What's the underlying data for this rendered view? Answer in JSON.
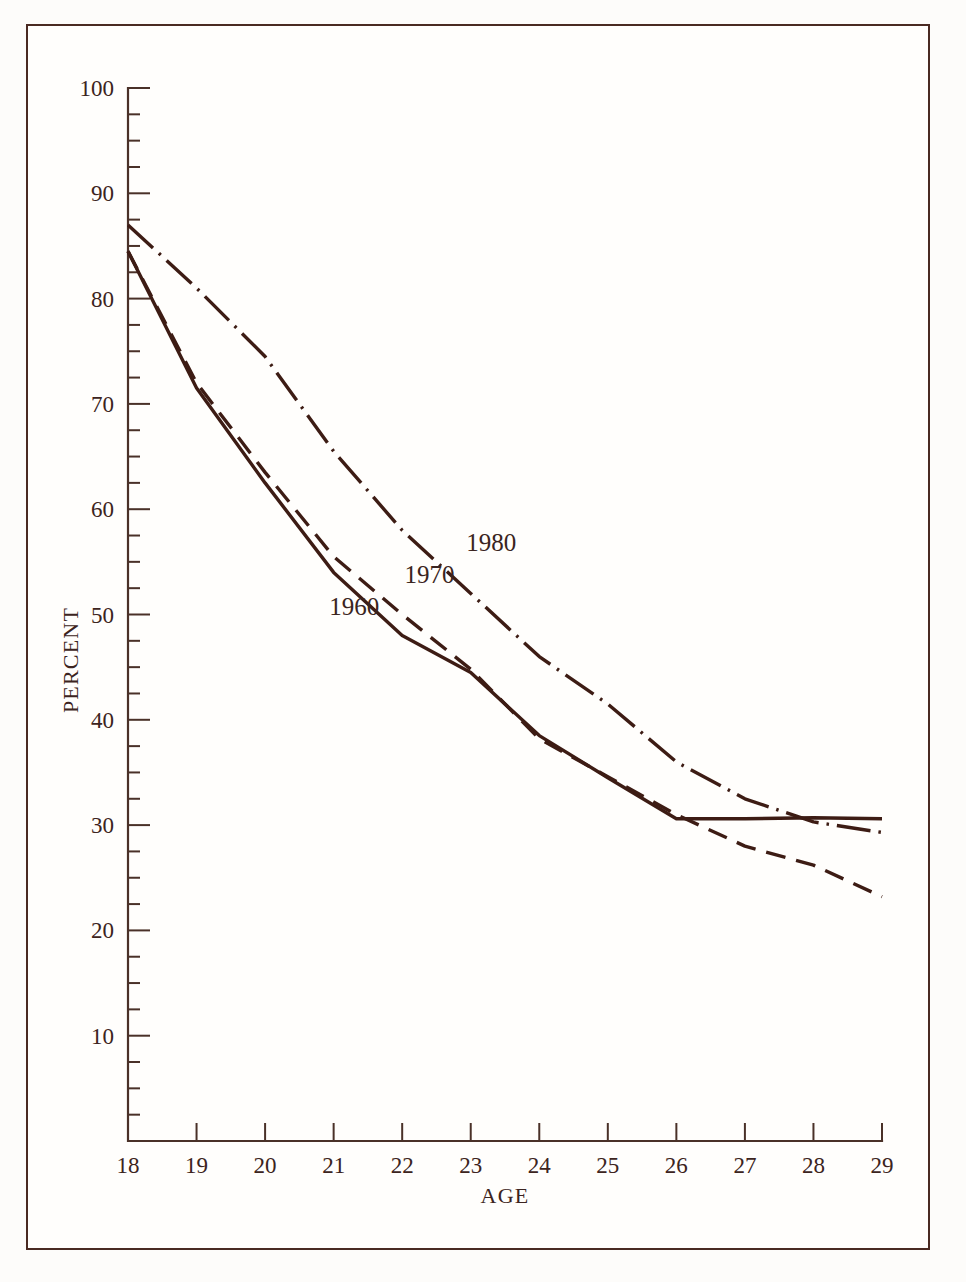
{
  "figure": {
    "background_color": "#fdfcfa",
    "frame_color": "#4a2a22",
    "line_color": "#3d1c14"
  },
  "chart_data": {
    "type": "line",
    "title": "",
    "subtitle": "",
    "xlabel": "AGE",
    "ylabel": "PERCENT",
    "xlim": [
      18,
      29
    ],
    "ylim": [
      0,
      100
    ],
    "grid": false,
    "legend_position": "inline-annotations",
    "x_ticks": [
      18,
      19,
      20,
      21,
      22,
      23,
      24,
      25,
      26,
      27,
      28,
      29
    ],
    "x_tick_labels": [
      "18",
      "19",
      "20",
      "21",
      "22",
      "23",
      "24",
      "25",
      "26",
      "27",
      "28",
      "29"
    ],
    "y_ticks": [
      10,
      20,
      30,
      40,
      50,
      60,
      70,
      80,
      90,
      100
    ],
    "y_tick_labels": [
      "10",
      "20",
      "30",
      "40",
      "50",
      "60",
      "70",
      "80",
      "90",
      "100"
    ],
    "y_minor_tick_step": 2.5,
    "x": [
      18,
      19,
      20,
      21,
      22,
      23,
      24,
      25,
      26,
      27,
      28,
      29
    ],
    "series": [
      {
        "name": "1960",
        "style": "solid",
        "values": [
          84.5,
          71.5,
          62.5,
          54.0,
          48.0,
          44.5,
          38.5,
          34.5,
          30.6,
          30.6,
          30.7,
          30.6
        ]
      },
      {
        "name": "1970",
        "style": "dashed",
        "values": [
          84.5,
          72.0,
          63.5,
          55.5,
          50.0,
          44.8,
          38.2,
          34.6,
          31.0,
          28.0,
          26.2,
          23.2
        ]
      },
      {
        "name": "1980",
        "style": "dash-dot",
        "values": [
          87.0,
          81.0,
          74.5,
          65.5,
          58.0,
          52.0,
          46.0,
          41.5,
          36.0,
          32.5,
          30.3,
          29.3
        ]
      }
    ],
    "annotations": [
      {
        "text": "1960",
        "x": 21.3,
        "y": 50.0
      },
      {
        "text": "1970",
        "x": 22.4,
        "y": 53.0
      },
      {
        "text": "1980",
        "x": 23.3,
        "y": 56.0
      }
    ]
  }
}
